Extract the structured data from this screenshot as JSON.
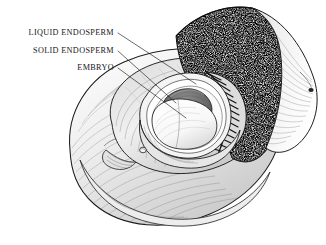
{
  "figure": {
    "style": "pen-and-ink stipple and hatch botanical illustration",
    "background_color": "#ffffff",
    "ink_color": "#1a1a1a",
    "width": 326,
    "height": 245
  },
  "labels": [
    {
      "id": "liquid-endosperm",
      "text": "LIQUID ENDOSPERM",
      "text_anchor_x": 113,
      "text_anchor_y": 34,
      "leader_from": [
        118,
        33
      ],
      "leader_to": [
        196,
        84
      ]
    },
    {
      "id": "solid-endosperm",
      "text": "SOLID ENDOSPERM",
      "text_anchor_x": 113,
      "text_anchor_y": 52,
      "leader_from": [
        118,
        51
      ],
      "leader_to": [
        176,
        103
      ]
    },
    {
      "id": "embryo",
      "text": "EMBRYO",
      "text_anchor_x": 113,
      "text_anchor_y": 69,
      "leader_from": [
        118,
        68
      ],
      "leader_to": [
        186,
        118
      ]
    }
  ],
  "structures": [
    {
      "id": "husk-mesocarp",
      "name": "fibrous husk (mesocarp)",
      "fill": "#f2f2f2"
    },
    {
      "id": "cut-husk-face",
      "name": "cut husk face (stippled)",
      "fill": "#d9d9d9"
    },
    {
      "id": "endocarp-shell",
      "name": "hard shell (endocarp)",
      "fill": "#555555"
    },
    {
      "id": "solid-endosperm",
      "name": "solid endosperm (coconut meat)",
      "fill": "#ffffff"
    },
    {
      "id": "liquid-endosperm",
      "name": "liquid endosperm cavity",
      "fill": "#767676"
    },
    {
      "id": "embryo",
      "name": "embryo",
      "fill": "#efefef"
    }
  ]
}
